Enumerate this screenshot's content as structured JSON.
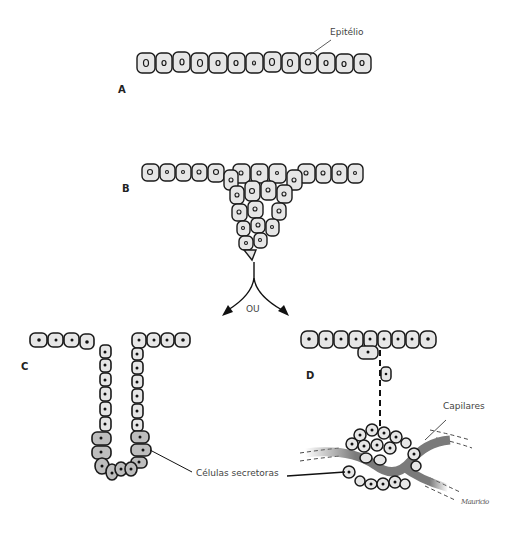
{
  "figure": {
    "panels": [
      {
        "id": "A",
        "label": "A",
        "description": "Epitélio simples (camada de células)"
      },
      {
        "id": "B",
        "label": "B",
        "description": "Proliferação de células epiteliais para o tecido subjacente"
      },
      {
        "id": "C",
        "label": "C",
        "description": "Glândula exócrina: ducto e porção secretora mantêm contato com o epitélio"
      },
      {
        "id": "D",
        "label": "D",
        "description": "Glândula endócrina: conexão desaparece; células secretoras junto aos capilares"
      }
    ],
    "annotations": {
      "epithelium": "Epitélio",
      "or": "OU",
      "secretory_cells": "Células secretoras",
      "capillaries": "Capilares"
    },
    "signature": "Mauricio",
    "colors": {
      "cell_fill": "#e6e6e6",
      "secretory_fill": "#bdbdbd",
      "outline": "#1a1a1a",
      "capillary": "#7a7a7a"
    }
  }
}
